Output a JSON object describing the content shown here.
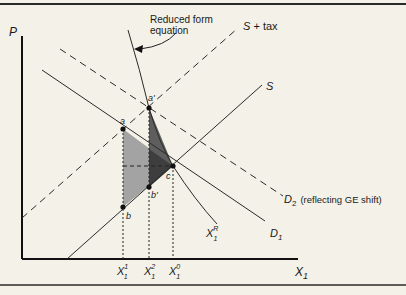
{
  "diagram": {
    "axes": {
      "y_label": "P",
      "x_label": "X",
      "x_label_sub": "1"
    },
    "annotation": {
      "line1": "Reduced form",
      "line2": "equation"
    },
    "curves": {
      "s_tax": "S + tax",
      "s": "S",
      "d1": "D",
      "d1_sub": "1",
      "d2": "D",
      "d2_sub": "2",
      "d2_note": "(reflecting GE shift)",
      "xr": "X",
      "xr_sub": "1",
      "xr_sup": "R"
    },
    "points": {
      "a": "a",
      "a_prime": "a'",
      "b": "b",
      "b_prime": "b'",
      "c": "c"
    },
    "ticks": [
      {
        "base": "X",
        "sub": "1",
        "sup": "1"
      },
      {
        "base": "X",
        "sub": "1",
        "sup": "2"
      },
      {
        "base": "X",
        "sub": "1",
        "sup": "0"
      }
    ],
    "colors": {
      "background": "#f4f1e8",
      "light_triangle": "#a3a3a3",
      "dark_triangle": "#5a5a5a",
      "overlap": "#3e3e3e",
      "line": "#2a2a2a"
    }
  }
}
